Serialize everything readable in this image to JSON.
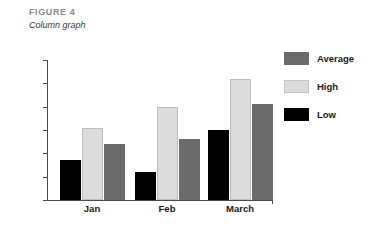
{
  "figure": {
    "label": "FIGURE 4",
    "caption": "Column graph"
  },
  "chart_data": {
    "type": "bar",
    "title": "",
    "xlabel": "",
    "ylabel": "",
    "categories": [
      "Jan",
      "Feb",
      "March"
    ],
    "series": [
      {
        "name": "Low",
        "values": [
          17,
          12,
          30
        ],
        "color": "#000000"
      },
      {
        "name": "High",
        "values": [
          31,
          40,
          52
        ],
        "color": "#dcdcdc"
      },
      {
        "name": "Average",
        "values": [
          24,
          26,
          41
        ],
        "color": "#6b6b6b"
      }
    ],
    "ylim": [
      0,
      60
    ],
    "yticks": [
      0,
      10,
      20,
      30,
      40,
      50,
      60
    ],
    "grid": false,
    "legend_position": "right",
    "legend_order": [
      "Average",
      "High",
      "Low"
    ]
  }
}
